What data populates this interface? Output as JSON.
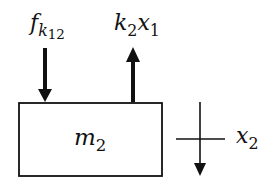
{
  "diagram": {
    "type": "free-body-diagram",
    "mass_label": {
      "symbol": "m",
      "subscript": "2"
    },
    "forces": [
      {
        "id": "f-k12",
        "symbol": "f",
        "subscript": "k",
        "sub_subscript": "12",
        "direction": "down"
      },
      {
        "id": "k2x1",
        "symbol": "k",
        "subscript": "2",
        "symbol2": "x",
        "subscript2": "1",
        "direction": "up"
      }
    ],
    "displacement": {
      "symbol": "x",
      "subscript": "2",
      "direction": "down"
    },
    "colors": {
      "stroke": "#111111",
      "background": "#ffffff"
    }
  }
}
